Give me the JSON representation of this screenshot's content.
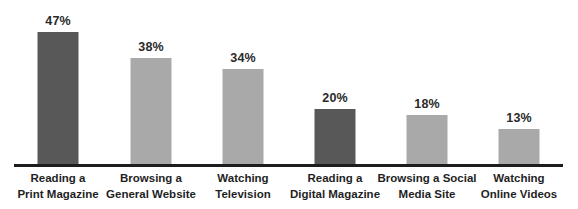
{
  "chart_data": {
    "type": "bar",
    "title": "",
    "subtitle": "",
    "xlabel": "",
    "ylabel": "",
    "ylim": [
      0,
      50
    ],
    "grid": false,
    "legend": null,
    "categories": [
      "Reading a Print Magazine",
      "Browsing a General Website",
      "Watching Television",
      "Reading a Digital Magazine",
      "Browsing a Social Media Site",
      "Watching Online Videos"
    ],
    "values": [
      47,
      38,
      34,
      20,
      18,
      13
    ],
    "value_labels": [
      "47%",
      "38%",
      "34%",
      "20%",
      "18%",
      "13%"
    ],
    "bar_colors": [
      "#585858",
      "#a9a9a9",
      "#a9a9a9",
      "#585858",
      "#a9a9a9",
      "#a9a9a9"
    ],
    "category_lines": [
      {
        "line1": "Reading a",
        "line2": "Print Magazine"
      },
      {
        "line1": "Browsing a",
        "line2": "General Website"
      },
      {
        "line1": "Watching",
        "line2": "Television"
      },
      {
        "line1": "Reading a",
        "line2": "Digital Magazine"
      },
      {
        "line1": "Browsing a Social",
        "line2": "Media Site"
      },
      {
        "line1": "Watching",
        "line2": "Online Videos"
      }
    ]
  },
  "colors": {
    "dark_bar": "#585858",
    "light_bar": "#a9a9a9",
    "axis": "#1d1d1d",
    "label_text": "#1f1f1f",
    "value_text": "#2a2a2a",
    "background": "#ffffff"
  }
}
